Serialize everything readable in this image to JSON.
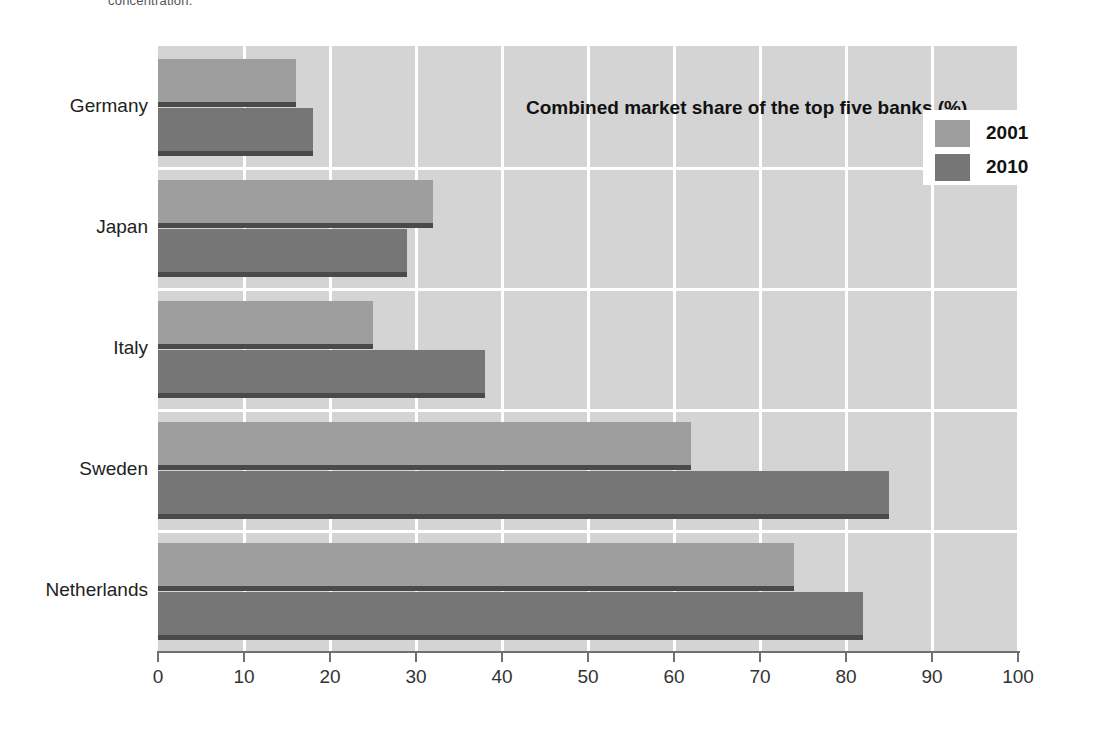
{
  "top_caption": "concentration.",
  "chart_data": {
    "type": "bar",
    "orientation": "horizontal",
    "title": "Combined market share of the top five banks (%)",
    "xlabel": "",
    "ylabel": "",
    "categories": [
      "Germany",
      "Japan",
      "Italy",
      "Sweden",
      "Netherlands"
    ],
    "series": [
      {
        "name": "2001",
        "color": "#9e9e9e",
        "values": [
          16,
          32,
          25,
          62,
          74
        ]
      },
      {
        "name": "2010",
        "color": "#767676",
        "values": [
          18,
          29,
          38,
          85,
          82
        ]
      }
    ],
    "xlim": [
      0,
      100
    ],
    "xticks": [
      0,
      10,
      20,
      30,
      40,
      50,
      60,
      70,
      80,
      90,
      100
    ],
    "xtick_labels": [
      "0",
      "10",
      "20",
      "30",
      "40",
      "50",
      "60",
      "70",
      "80",
      "90",
      "100"
    ],
    "grid": true,
    "grid_axis": "x",
    "legend_position": "top-right",
    "plot_background": "#d4d4d4",
    "gridline_color": "#ffffff"
  }
}
